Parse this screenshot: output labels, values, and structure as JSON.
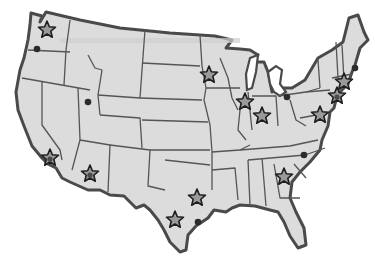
{
  "map": {
    "title": "",
    "region": "Contiguous United States",
    "style": "grayscale hand-drawn state outline",
    "colors": {
      "land": "#dcdcdc",
      "outline": "#4a4a4a",
      "star_fill": "#9a9a9a",
      "star_stroke": "#1e1e1e",
      "dot": "#2b2b2b",
      "background": "#ffffff"
    },
    "star_markers": [
      {
        "id": "star-seattle",
        "area": "Washington (Seattle)",
        "x": 47,
        "y": 30
      },
      {
        "id": "star-los-angeles",
        "area": "Southern California",
        "x": 50,
        "y": 158,
        "dark_center": true
      },
      {
        "id": "star-phoenix",
        "area": "Arizona",
        "x": 90,
        "y": 174,
        "dark_center": true
      },
      {
        "id": "star-minneapolis",
        "area": "Minnesota",
        "x": 209,
        "y": 75
      },
      {
        "id": "star-chicago",
        "area": "Illinois (Chicago)",
        "x": 245,
        "y": 102
      },
      {
        "id": "star-indianapolis",
        "area": "Indiana",
        "x": 262,
        "y": 116
      },
      {
        "id": "star-dc",
        "area": "Virginia / DC",
        "x": 320,
        "y": 115
      },
      {
        "id": "star-new-jersey",
        "area": "New Jersey / Philadelphia",
        "x": 337,
        "y": 96,
        "dark_center": true
      },
      {
        "id": "star-new-york",
        "area": "New York / Connecticut",
        "x": 344,
        "y": 82
      },
      {
        "id": "star-dallas",
        "area": "North Texas",
        "x": 197,
        "y": 198
      },
      {
        "id": "star-san-antonio",
        "area": "South Texas",
        "x": 175,
        "y": 220
      },
      {
        "id": "star-atlanta",
        "area": "Georgia",
        "x": 284,
        "y": 177
      }
    ],
    "dot_markers": [
      {
        "id": "dot-portland",
        "area": "Oregon",
        "x": 37,
        "y": 49
      },
      {
        "id": "dot-salt-lake",
        "area": "Utah",
        "x": 88,
        "y": 102
      },
      {
        "id": "dot-detroit",
        "area": "Michigan / Ohio",
        "x": 287,
        "y": 97
      },
      {
        "id": "dot-charlotte",
        "area": "North Carolina",
        "x": 304,
        "y": 155
      },
      {
        "id": "dot-houston",
        "area": "Texas Gulf",
        "x": 198,
        "y": 222
      },
      {
        "id": "dot-maine",
        "area": "New England coast",
        "x": 355,
        "y": 68
      }
    ]
  }
}
